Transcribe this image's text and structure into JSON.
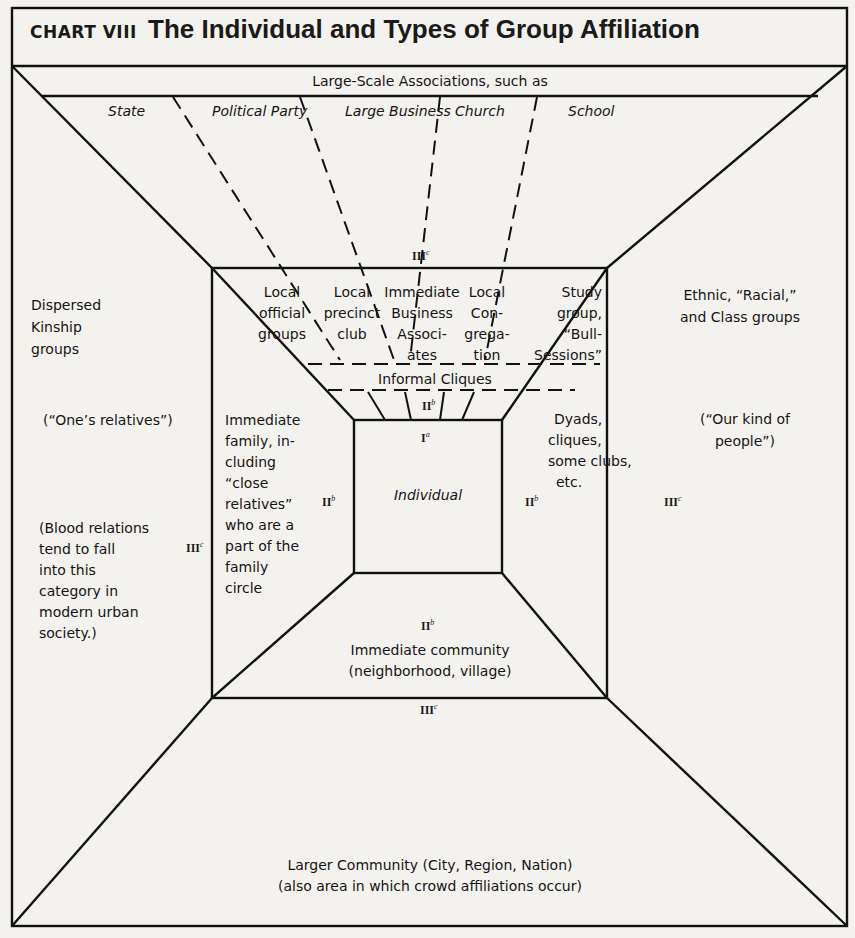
{
  "header": {
    "chart_number": "CHART VIII",
    "title": "The Individual and Types of Group Affiliation"
  },
  "large_scale": {
    "heading": "Large-Scale Associations, such as",
    "items": [
      "State",
      "Political Party",
      "Large Business",
      "Church",
      "School"
    ],
    "level": "III",
    "level_sup": "c"
  },
  "local_groups": {
    "items": [
      [
        "Local",
        "official",
        "groups"
      ],
      [
        "Local",
        "precinct",
        "club"
      ],
      [
        "Immediate",
        "Business",
        "Associ-",
        "ates"
      ],
      [
        "Local",
        "Con-",
        "grega-",
        "tion"
      ],
      [
        "Study",
        "group,",
        "“Bull-",
        "Sessions”"
      ]
    ],
    "cliques": "Informal Cliques",
    "cliques_level": "II",
    "cliques_level_sup": "b"
  },
  "kinship": {
    "title_lines": [
      "Dispersed",
      "Kinship",
      "groups"
    ],
    "subtitle": "(“One’s relatives”)",
    "note_lines": [
      "(Blood relations",
      "tend to fall",
      "into this",
      "category in",
      "modern urban",
      "society.)"
    ],
    "level": "III",
    "level_sup": "c"
  },
  "family": {
    "lines": [
      "Immediate",
      "family, in-",
      "cluding",
      "“close",
      "relatives”",
      "who are a",
      "part of the",
      "family",
      "circle"
    ],
    "level": "II",
    "level_sup": "b"
  },
  "individual": {
    "label": "Individual",
    "level": "I",
    "level_sup": "a"
  },
  "dyads": {
    "lines": [
      "Dyads,",
      "cliques,",
      "some clubs,",
      "etc."
    ],
    "level": "II",
    "level_sup": "b"
  },
  "ethnic": {
    "title_lines": [
      "Ethnic, “Racial,”",
      "and Class groups"
    ],
    "subtitle_lines": [
      "(“Our kind of",
      "people”)"
    ],
    "level": "III",
    "level_sup": "c"
  },
  "immediate_community": {
    "lines": [
      "Immediate community",
      "(neighborhood, village)"
    ],
    "level": "II",
    "level_sup": "b"
  },
  "larger_community": {
    "lines": [
      "Larger Community (City, Region, Nation)",
      "(also area in which crowd affiliations occur)"
    ],
    "level": "III",
    "level_sup": "c"
  }
}
